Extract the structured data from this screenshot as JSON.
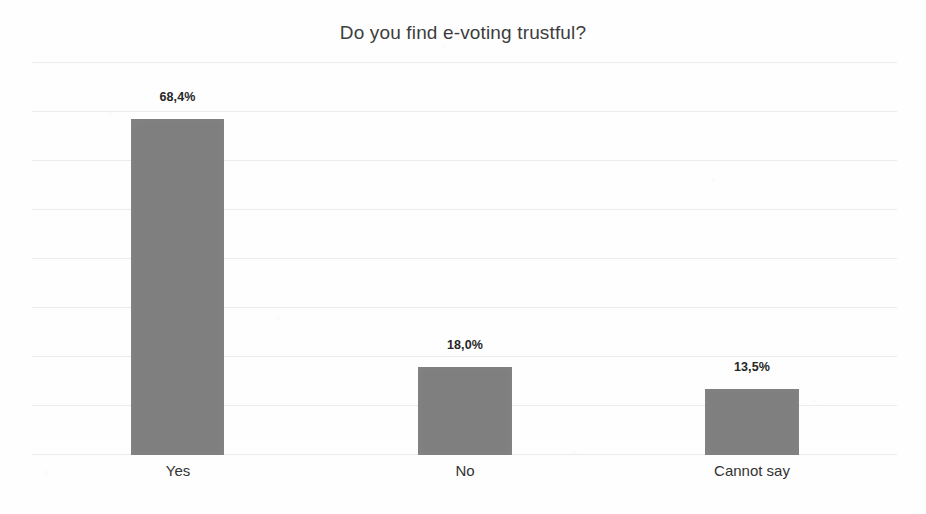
{
  "chart_data": {
    "type": "bar",
    "title": "Do you find e-voting trustful?",
    "subtitle": "",
    "xlabel": "",
    "ylabel": "",
    "categories": [
      "Yes",
      "No",
      "Cannot say"
    ],
    "values": [
      68.4,
      18.0,
      13.5
    ],
    "data_labels": [
      "68,4%",
      "18,0%",
      "13,5%"
    ],
    "ylim": [
      0,
      80
    ],
    "y_tick_step": 10,
    "y_tick_values": [
      0,
      10,
      20,
      30,
      40,
      50,
      60,
      70,
      80
    ],
    "y_tick_labels_visible": false,
    "grid": true,
    "grid_axis": "y",
    "legend": false,
    "legend_position": "none",
    "series": [
      {
        "name": "Responses",
        "values": [
          68.4,
          18.0,
          13.5
        ]
      }
    ],
    "colors": {
      "bar": "#7f7f7f",
      "gridline": "#e9ecef",
      "title_text": "#3d3d3d",
      "label_text": "#262626",
      "category_text": "#333333",
      "background": "#fefefe"
    }
  }
}
